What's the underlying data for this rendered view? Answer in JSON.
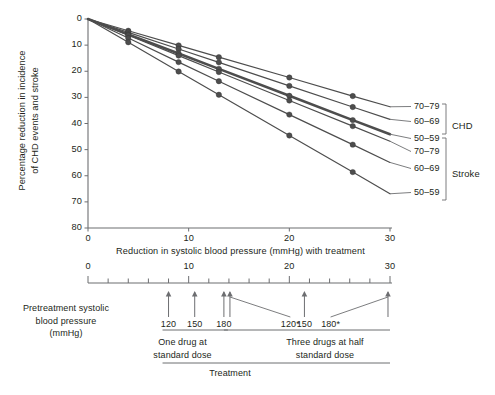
{
  "chart_data": {
    "type": "line",
    "title": "",
    "xlabel": "Reduction in systolic blood pressure (mmHg) with treatment",
    "ylabel": "Percentage reduction in incidence\nof CHD events and stroke",
    "xlim": [
      0,
      30
    ],
    "ylim": [
      0,
      80
    ],
    "y_inverted": true,
    "grid": false,
    "x_ticks": [
      0,
      10,
      20,
      30
    ],
    "x_tick_labels": [
      "0",
      "10",
      "20",
      "30"
    ],
    "y_ticks": [
      0,
      10,
      20,
      30,
      40,
      50,
      60,
      70,
      80
    ],
    "y_tick_labels": [
      "0",
      "10",
      "20",
      "30",
      "40",
      "50",
      "60",
      "70",
      "80"
    ],
    "legend_position": "right",
    "x_marker_positions": [
      4.0,
      9.0,
      13.0,
      20.0,
      26.3
    ],
    "series": [
      {
        "name": "CHD 70–79",
        "outcome": "CHD",
        "age": "70–79",
        "slope_pct_per_mmHg": 1.12,
        "color": "#4d4d4d",
        "width": 1.2,
        "x": [
          0,
          4.0,
          9.0,
          13.0,
          20.0,
          26.3,
          30.0
        ],
        "values": [
          0,
          4.5,
          10.1,
          14.6,
          22.4,
          29.5,
          33.6
        ]
      },
      {
        "name": "CHD 60–69",
        "outcome": "CHD",
        "age": "60–69",
        "slope_pct_per_mmHg": 1.28,
        "color": "#4d4d4d",
        "width": 1.2,
        "x": [
          0,
          4.0,
          9.0,
          13.0,
          20.0,
          26.3,
          30.0
        ],
        "values": [
          0,
          5.1,
          11.5,
          16.6,
          25.6,
          33.7,
          38.4
        ]
      },
      {
        "name": "CHD 50–59",
        "outcome": "CHD",
        "age": "50–59",
        "slope_pct_per_mmHg": 1.47,
        "color": "#4d4d4d",
        "width": 2.6,
        "x": [
          0,
          4.0,
          9.0,
          13.0,
          20.0,
          26.3,
          30.0
        ],
        "values": [
          0,
          5.9,
          13.2,
          19.1,
          29.4,
          38.7,
          44.1
        ]
      },
      {
        "name": "Stroke 70–79",
        "outcome": "Stroke",
        "age": "70–79",
        "slope_pct_per_mmHg": 1.56,
        "color": "#4d4d4d",
        "width": 1.2,
        "x": [
          0,
          4.0,
          9.0,
          13.0,
          20.0,
          26.3,
          30.0
        ],
        "values": [
          0,
          6.2,
          14.0,
          20.3,
          31.2,
          41.0,
          46.8
        ]
      },
      {
        "name": "Stroke 60–69",
        "outcome": "Stroke",
        "age": "60–69",
        "slope_pct_per_mmHg": 1.83,
        "color": "#4d4d4d",
        "width": 1.2,
        "x": [
          0,
          4.0,
          9.0,
          13.0,
          20.0,
          26.3,
          30.0
        ],
        "values": [
          0,
          7.3,
          16.5,
          23.8,
          36.6,
          48.1,
          54.9
        ]
      },
      {
        "name": "Stroke 50–59",
        "outcome": "Stroke",
        "age": "50–59",
        "slope_pct_per_mmHg": 2.23,
        "color": "#4d4d4d",
        "width": 1.2,
        "x": [
          0,
          4.0,
          9.0,
          13.0,
          20.0,
          26.3,
          30.0
        ],
        "values": [
          0,
          8.9,
          20.1,
          29.0,
          44.6,
          58.6,
          66.9
        ]
      }
    ],
    "legend": [
      {
        "label": "70–79",
        "group": "CHD"
      },
      {
        "label": "60–69",
        "group": "CHD"
      },
      {
        "label": "50–59",
        "group": "CHD"
      },
      {
        "label": "70–79",
        "group": "Stroke"
      },
      {
        "label": "60–69",
        "group": "Stroke"
      },
      {
        "label": "50–59",
        "group": "Stroke"
      }
    ],
    "group_labels": [
      "CHD",
      "Stroke"
    ],
    "annotation_panel": {
      "ruler_ticks_major": [
        0,
        10,
        20,
        30
      ],
      "ruler_tick_labels": [
        "0",
        "10",
        "20",
        "30"
      ],
      "ruler_minor_step": 2,
      "side_label": "Pretreatment systolic\nblood pressure\n(mmHg)",
      "arrows": [
        {
          "label": "120",
          "x": 8.0
        },
        {
          "label": "150",
          "x": 10.6
        },
        {
          "label": "180",
          "x": 13.5
        },
        {
          "label": "120*",
          "x": 14.1,
          "leader": true
        },
        {
          "label": "150",
          "x": 21.5
        },
        {
          "label": "180*",
          "x": 29.8,
          "leader": true
        }
      ],
      "brackets": [
        {
          "label": "One drug at\nstandard dose",
          "x_start": 8.0,
          "x_end": 13.9
        },
        {
          "label": "Three drugs at half\nstandard dose",
          "x_start": 14.1,
          "x_end": 30.0
        }
      ],
      "overall_label": "Treatment"
    }
  },
  "legend_groups": {
    "chd": "CHD",
    "stroke": "Stroke"
  }
}
